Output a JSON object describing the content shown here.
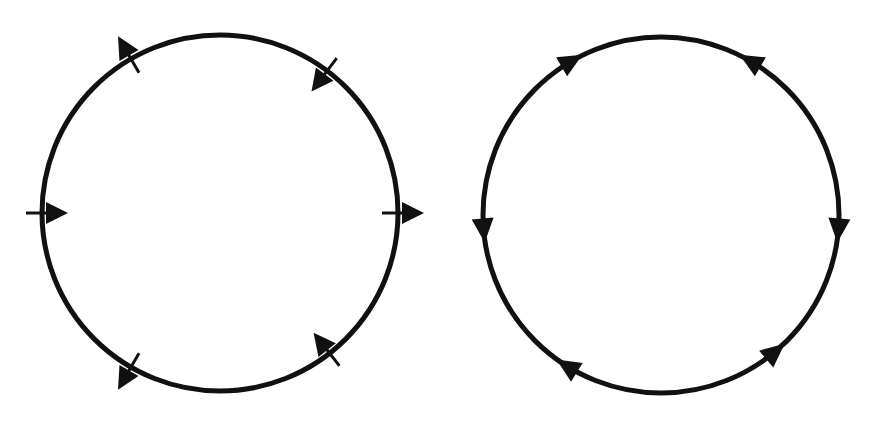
{
  "diagram": {
    "background": "#ffffff",
    "stroke_color": "#111111",
    "panels": [
      {
        "name": "left-circle-normal-arrows",
        "center": [
          220,
          213
        ],
        "radius": 178,
        "stroke_width": 5,
        "arrow_type": "crossing",
        "arrows": [
          {
            "angle_deg": 240,
            "direction": "outward"
          },
          {
            "angle_deg": 307,
            "direction": "inward"
          },
          {
            "angle_deg": 180,
            "direction": "inward"
          },
          {
            "angle_deg": 0,
            "direction": "outward"
          },
          {
            "angle_deg": 120,
            "direction": "outward"
          },
          {
            "angle_deg": 52,
            "direction": "inward"
          }
        ]
      },
      {
        "name": "right-circle-tangent-arrows",
        "center": [
          661,
          215
        ],
        "radius": 178,
        "stroke_width": 5,
        "arrow_type": "tangent",
        "arrows": [
          {
            "angle_deg": 240,
            "direction": "cw"
          },
          {
            "angle_deg": 300,
            "direction": "ccw"
          },
          {
            "angle_deg": 175,
            "direction": "ccw"
          },
          {
            "angle_deg": 5,
            "direction": "cw"
          },
          {
            "angle_deg": 122,
            "direction": "cw"
          },
          {
            "angle_deg": 50,
            "direction": "ccw"
          }
        ]
      }
    ]
  }
}
